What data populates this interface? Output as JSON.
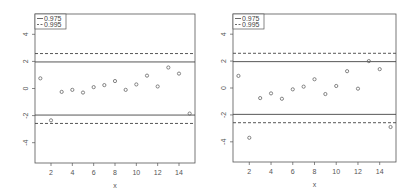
{
  "chart_data": [
    {
      "type": "scatter",
      "title": "",
      "xlabel": "x",
      "ylabel": "",
      "xlim": [
        0.5,
        15.5
      ],
      "ylim": [
        -5.5,
        5.5
      ],
      "xticks": [
        2,
        4,
        6,
        8,
        10,
        12,
        14
      ],
      "yticks": [
        -4,
        -2,
        0,
        2,
        4
      ],
      "grid": false,
      "legend_position": "top-left",
      "legend": [
        {
          "label": "0.975",
          "style": "solid"
        },
        {
          "label": "0.995",
          "style": "dashed"
        }
      ],
      "hlines": [
        {
          "y": 1.96,
          "style": "solid"
        },
        {
          "y": -1.96,
          "style": "solid"
        },
        {
          "y": 2.58,
          "style": "dashed"
        },
        {
          "y": -2.58,
          "style": "dashed"
        }
      ],
      "x": [
        1,
        2,
        3,
        4,
        5,
        6,
        7,
        8,
        9,
        10,
        11,
        12,
        13,
        14,
        15
      ],
      "y": [
        0.75,
        -2.35,
        -0.25,
        -0.1,
        -0.3,
        0.1,
        0.25,
        0.55,
        -0.1,
        0.3,
        0.95,
        0.15,
        1.55,
        1.1,
        -1.85
      ]
    },
    {
      "type": "scatter",
      "title": "",
      "xlabel": "x",
      "ylabel": "",
      "xlim": [
        0.5,
        15.5
      ],
      "ylim": [
        -5.5,
        5.5
      ],
      "xticks": [
        2,
        4,
        6,
        8,
        10,
        12,
        14
      ],
      "yticks": [
        -4,
        -2,
        0,
        2,
        4
      ],
      "grid": false,
      "legend_position": "top-left",
      "legend": [
        {
          "label": "0.975",
          "style": "solid"
        },
        {
          "label": "0.995",
          "style": "dashed"
        }
      ],
      "hlines": [
        {
          "y": 1.96,
          "style": "solid"
        },
        {
          "y": -1.96,
          "style": "solid"
        },
        {
          "y": 2.58,
          "style": "dashed"
        },
        {
          "y": -2.58,
          "style": "dashed"
        }
      ],
      "x": [
        1,
        2,
        3,
        4,
        5,
        6,
        7,
        8,
        9,
        10,
        11,
        12,
        13,
        14,
        15
      ],
      "y": [
        0.9,
        -3.7,
        -0.75,
        -0.4,
        -0.8,
        -0.1,
        0.1,
        0.65,
        -0.45,
        0.15,
        1.25,
        -0.05,
        2.0,
        1.4,
        -2.9
      ]
    }
  ],
  "panels": [
    {
      "legend": {
        "solid_label": "0.975",
        "dashed_label": "0.995"
      },
      "xlabel": "x"
    },
    {
      "legend": {
        "solid_label": "0.975",
        "dashed_label": "0.995"
      },
      "xlabel": "x"
    }
  ],
  "colors": {
    "axis": "#555555",
    "line": "#444444",
    "point": "#666666"
  }
}
